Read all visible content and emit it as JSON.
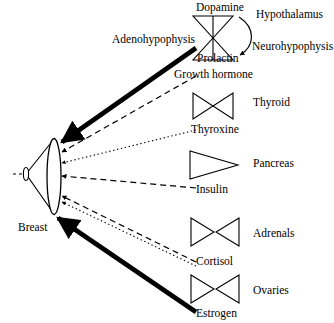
{
  "diagram": {
    "title_present": false,
    "organ": {
      "label": "Breast",
      "x": 18,
      "y": 222
    },
    "pituitary_lobes": [
      {
        "name": "adenohypophysis-label",
        "label": "Adenohypophysis",
        "x": 112,
        "y": 34
      },
      {
        "name": "neurohypophysis-label",
        "label": "Neurohypophysis",
        "x": 252,
        "y": 41
      }
    ],
    "hypothalamus": {
      "label": "Hypothalamus",
      "x": 256,
      "y": 9
    },
    "axis_top": {
      "upper_hormone": {
        "label": "Dopamine",
        "x": 196,
        "y": 2
      },
      "lower_hormone": {
        "label": "Prolactin",
        "x": 197,
        "y": 53
      }
    },
    "rows": [
      {
        "name": "prolactin",
        "hormone": "Prolactin",
        "hormone_x": 197,
        "hormone_y": 53,
        "gland": "Adenohypophysis",
        "gland_x": 112,
        "gland_y": 34,
        "line_style": "thick-solid",
        "line_color": "#000000"
      },
      {
        "name": "growth-hormone",
        "hormone": "Growth hormone",
        "hormone_x": 174,
        "hormone_y": 69,
        "gland": "",
        "gland_x": 0,
        "gland_y": 0,
        "line_style": "dashed",
        "line_color": "#000000"
      },
      {
        "name": "thyroxine",
        "hormone": "Thyroxine",
        "hormone_x": 191,
        "hormone_y": 124,
        "gland": "Thyroid",
        "gland_x": 253,
        "gland_y": 97,
        "line_style": "dotted",
        "line_color": "#000000"
      },
      {
        "name": "insulin",
        "hormone": "Insulin",
        "hormone_x": 196,
        "hormone_y": 184,
        "gland": "Pancreas",
        "gland_x": 253,
        "gland_y": 158,
        "line_style": "dashed",
        "line_color": "#000000"
      },
      {
        "name": "cortisol",
        "hormone": "Cortisol",
        "hormone_x": 196,
        "hormone_y": 256,
        "gland": "Adrenals",
        "gland_x": 253,
        "gland_y": 228,
        "line_style": "dashed-and-dotted",
        "line_color": "#000000"
      },
      {
        "name": "estrogen",
        "hormone": "Estrogen",
        "hormone_x": 196,
        "hormone_y": 308,
        "gland": "Ovaries",
        "gland_x": 253,
        "gland_y": 285,
        "line_style": "thick-solid",
        "line_color": "#000000"
      }
    ],
    "gland_glyphs": [
      {
        "name": "pituitary-hourglass-glyph",
        "shape": "hourglass"
      },
      {
        "name": "thyroid-hourglass-glyph",
        "shape": "hourglass"
      },
      {
        "name": "pancreas-triangle-glyph",
        "shape": "triangle-right"
      },
      {
        "name": "adrenals-pair-glyph",
        "shape": "triangle-pair"
      },
      {
        "name": "ovaries-pair-glyph",
        "shape": "triangle-pair"
      }
    ],
    "colors": {
      "stroke": "#000000",
      "background": "#ffffff"
    }
  }
}
